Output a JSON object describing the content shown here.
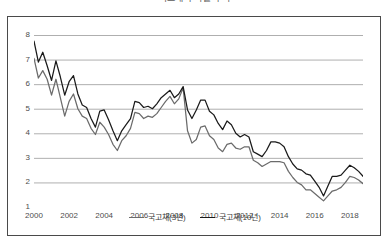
{
  "chart_data": {
    "type": "line",
    "title": "국고채 수익률 추이",
    "xlabel": "",
    "ylabel": "",
    "xlim": [
      2000,
      2018.75
    ],
    "ylim": [
      1,
      8
    ],
    "grid": true,
    "grid_axis": "y",
    "legend_position": "bottom-center",
    "yticks": [
      1,
      2,
      3,
      4,
      5,
      6,
      7,
      8
    ],
    "ytick_labels": [
      "1",
      "2",
      "3",
      "4",
      "5",
      "6",
      "7",
      "8"
    ],
    "xticks": [
      2000,
      2002,
      2004,
      2006,
      2008,
      2010,
      2012,
      2014,
      2016,
      2018
    ],
    "xtick_labels": [
      "2000",
      "2002",
      "2004",
      "2006",
      "2008",
      "2010",
      "2012",
      "2014",
      "2016",
      "2018"
    ],
    "series": [
      {
        "name": "국고채(3년)",
        "color": "#6b6b6b",
        "x": [
          2000.0,
          2000.25,
          2000.5,
          2000.75,
          2001.0,
          2001.25,
          2001.5,
          2001.75,
          2002.0,
          2002.25,
          2002.5,
          2002.75,
          2003.0,
          2003.25,
          2003.5,
          2003.75,
          2004.0,
          2004.25,
          2004.5,
          2004.75,
          2005.0,
          2005.25,
          2005.5,
          2005.75,
          2006.0,
          2006.25,
          2006.5,
          2006.75,
          2007.0,
          2007.25,
          2007.5,
          2007.75,
          2008.0,
          2008.25,
          2008.5,
          2008.75,
          2009.0,
          2009.25,
          2009.5,
          2009.75,
          2010.0,
          2010.25,
          2010.5,
          2010.75,
          2011.0,
          2011.25,
          2011.5,
          2011.75,
          2012.0,
          2012.25,
          2012.5,
          2012.75,
          2013.0,
          2013.25,
          2013.5,
          2013.75,
          2014.0,
          2014.25,
          2014.5,
          2014.75,
          2015.0,
          2015.25,
          2015.5,
          2015.75,
          2016.0,
          2016.25,
          2016.5,
          2016.75,
          2017.0,
          2017.25,
          2017.5,
          2017.75,
          2018.0,
          2018.25,
          2018.5,
          2018.75
        ],
        "values": [
          7.05,
          6.25,
          6.55,
          6.2,
          5.55,
          6.2,
          5.45,
          4.7,
          5.3,
          5.6,
          5.0,
          4.7,
          4.6,
          4.2,
          3.95,
          4.45,
          4.25,
          3.95,
          3.55,
          3.3,
          3.7,
          3.9,
          4.2,
          4.85,
          4.8,
          4.6,
          4.7,
          4.65,
          4.8,
          5.05,
          5.3,
          5.5,
          5.2,
          5.4,
          5.85,
          4.1,
          3.6,
          3.75,
          4.25,
          4.3,
          3.9,
          3.75,
          3.4,
          3.25,
          3.55,
          3.6,
          3.4,
          3.35,
          3.45,
          3.45,
          2.9,
          2.8,
          2.65,
          2.75,
          2.85,
          2.85,
          2.85,
          2.8,
          2.45,
          2.2,
          2.0,
          1.9,
          1.7,
          1.7,
          1.55,
          1.4,
          1.25,
          1.45,
          1.65,
          1.7,
          1.8,
          2.0,
          2.25,
          2.2,
          2.1,
          1.95
        ]
      },
      {
        "name": "국고채(10년)",
        "color": "#1a1a1a",
        "x": [
          2000.0,
          2000.25,
          2000.5,
          2000.75,
          2001.0,
          2001.25,
          2001.5,
          2001.75,
          2002.0,
          2002.25,
          2002.5,
          2002.75,
          2003.0,
          2003.25,
          2003.5,
          2003.75,
          2004.0,
          2004.25,
          2004.5,
          2004.75,
          2005.0,
          2005.25,
          2005.5,
          2005.75,
          2006.0,
          2006.25,
          2006.5,
          2006.75,
          2007.0,
          2007.25,
          2007.5,
          2007.75,
          2008.0,
          2008.25,
          2008.5,
          2008.75,
          2009.0,
          2009.25,
          2009.5,
          2009.75,
          2010.0,
          2010.25,
          2010.5,
          2010.75,
          2011.0,
          2011.25,
          2011.5,
          2011.75,
          2012.0,
          2012.25,
          2012.5,
          2012.75,
          2013.0,
          2013.25,
          2013.5,
          2013.75,
          2014.0,
          2014.25,
          2014.5,
          2014.75,
          2015.0,
          2015.25,
          2015.5,
          2015.75,
          2016.0,
          2016.25,
          2016.5,
          2016.75,
          2017.0,
          2017.25,
          2017.5,
          2017.75,
          2018.0,
          2018.25,
          2018.5,
          2018.75
        ],
        "values": [
          7.75,
          6.9,
          7.3,
          6.75,
          6.15,
          6.95,
          6.3,
          5.55,
          6.1,
          6.35,
          5.6,
          5.15,
          5.05,
          4.6,
          4.25,
          4.9,
          4.95,
          4.55,
          4.1,
          3.7,
          4.1,
          4.35,
          4.6,
          5.3,
          5.25,
          5.05,
          5.1,
          5.0,
          5.2,
          5.45,
          5.6,
          5.75,
          5.45,
          5.6,
          5.9,
          4.95,
          4.6,
          4.95,
          5.35,
          5.35,
          4.9,
          4.75,
          4.4,
          4.15,
          4.5,
          4.35,
          4.0,
          3.85,
          3.95,
          3.85,
          3.25,
          3.15,
          3.05,
          3.3,
          3.65,
          3.65,
          3.6,
          3.45,
          3.05,
          2.75,
          2.55,
          2.5,
          2.35,
          2.3,
          2.05,
          1.8,
          1.45,
          1.85,
          2.25,
          2.25,
          2.3,
          2.5,
          2.7,
          2.6,
          2.45,
          2.25
        ]
      }
    ]
  },
  "legend": {
    "items": [
      {
        "label": "국고채(3년)",
        "color": "#6b6b6b"
      },
      {
        "label": "국고채(10년)",
        "color": "#1a1a1a"
      }
    ]
  },
  "axes": {
    "y_labels": [
      "8",
      "7",
      "6",
      "5",
      "4",
      "3",
      "2",
      "1"
    ],
    "x_labels": [
      "2000",
      "2002",
      "2004",
      "2006",
      "2008",
      "2010",
      "2012",
      "2014",
      "2016",
      "2018"
    ]
  }
}
